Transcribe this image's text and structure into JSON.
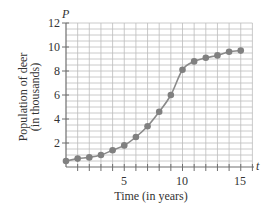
{
  "chart_data": {
    "type": "line",
    "title": "",
    "xlabel": "Time (in years)",
    "ylabel": "Population of deer",
    "ylabel_line2": "(in thousands)",
    "x_var": "t",
    "y_var": "P",
    "xlim": [
      0,
      16
    ],
    "ylim": [
      0,
      12
    ],
    "grid": true,
    "x_ticks": [
      5,
      10,
      15
    ],
    "y_ticks": [
      2,
      4,
      6,
      8,
      10,
      12
    ],
    "x": [
      0,
      1,
      2,
      3,
      4,
      5,
      6,
      7,
      8,
      9,
      10,
      11,
      12,
      13,
      14,
      15
    ],
    "series": [
      {
        "name": "Deer population",
        "values": [
          0.5,
          0.7,
          0.8,
          1.0,
          1.4,
          1.8,
          2.5,
          3.4,
          4.6,
          6.0,
          8.1,
          8.8,
          9.1,
          9.3,
          9.6,
          9.7
        ]
      }
    ],
    "legend": "none"
  },
  "labels": {
    "x_axis": "Time (in years)",
    "y_axis_line1": "Population of deer",
    "y_axis_line2": "(in thousands)",
    "x_var": "t",
    "y_var": "P",
    "x_tick_5": "5",
    "x_tick_10": "10",
    "x_tick_15": "15",
    "y_tick_2": "2",
    "y_tick_4": "4",
    "y_tick_6": "6",
    "y_tick_8": "8",
    "y_tick_10": "10",
    "y_tick_12": "12"
  },
  "colors": {
    "grid": "#bdbdbd",
    "axis": "#6f6f6f",
    "curve": "#8a8a8a",
    "points": "#808080"
  }
}
